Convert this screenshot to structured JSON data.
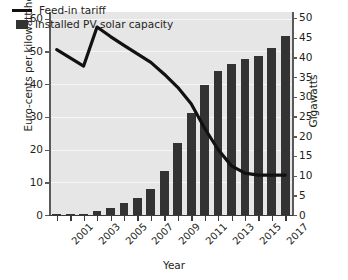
{
  "chart_data": {
    "type": "bar",
    "title": "",
    "xlabel": "Year",
    "ylabel": "Euro-cents per kilowatt-hour",
    "ylabel_right": "Gigawatts",
    "grid": true,
    "legend_position": "top-left",
    "x": [
      "2001",
      "2002",
      "2003",
      "2004",
      "2005",
      "2006",
      "2007",
      "2008",
      "2009",
      "2010",
      "2011",
      "2012",
      "2013",
      "2014",
      "2015",
      "2016",
      "2017",
      "2018"
    ],
    "xtick_labels": [
      "2001",
      "2003",
      "2005",
      "2007",
      "2009",
      "2011",
      "2013",
      "2015",
      "2017"
    ],
    "ylim": [
      0,
      62
    ],
    "ytick_labels": [
      "0",
      "10",
      "20",
      "30",
      "40",
      "50",
      "60"
    ],
    "ytick_values": [
      0,
      10,
      20,
      30,
      40,
      50,
      60
    ],
    "ylim_right": [
      0,
      51.5
    ],
    "ytick_labels_right": [
      "0",
      "5",
      "10",
      "15",
      "20",
      "25",
      "30",
      "35",
      "40",
      "45",
      "50"
    ],
    "ytick_values_right": [
      0,
      5,
      10,
      15,
      20,
      25,
      30,
      35,
      40,
      45,
      50
    ],
    "series": [
      {
        "name": "Feed-in tariff",
        "type": "line",
        "axis": "left",
        "unit": "Euro-cents per kilowatt-hour",
        "color": "#111111",
        "values": [
          50.5,
          48.0,
          45.5,
          57.4,
          54.5,
          51.8,
          49.2,
          46.6,
          43.0,
          39.0,
          34.0,
          26.5,
          20.0,
          15.0,
          12.8,
          12.2,
          12.2,
          12.2
        ]
      },
      {
        "name": "Installed PV solar capacity",
        "type": "bar",
        "axis": "right",
        "unit": "Gigawatts",
        "color": "#333333",
        "values": [
          0.1,
          0.2,
          0.3,
          1.1,
          1.9,
          3.0,
          4.2,
          6.5,
          11.2,
          18.2,
          25.8,
          33.0,
          36.5,
          38.2,
          39.7,
          40.4,
          42.4,
          45.5
        ]
      }
    ]
  },
  "legend": {
    "items": [
      {
        "label": "Feed-in tariff",
        "marker": "line"
      },
      {
        "label": "Installed PV solar capacity",
        "marker": "square"
      }
    ]
  },
  "axes": {
    "x_title": "Year",
    "y_left_title": "Euro-cents per kilowatt-hour",
    "y_right_title": "Gigawatts"
  },
  "colors": {
    "bar": "#333333",
    "line": "#111111",
    "plot_background": "#e6e6e6",
    "gridline": "#f6f6f6",
    "axis": "#3a3a3a",
    "text": "#231f20"
  }
}
